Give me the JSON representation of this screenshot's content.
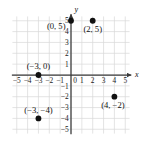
{
  "chart_data": {
    "type": "scatter",
    "title": "",
    "xlabel": "x",
    "ylabel": "y",
    "xlim": [
      -5.5,
      5.5
    ],
    "ylim": [
      -5.5,
      5.5
    ],
    "grid": true,
    "grid_step": 1,
    "legend": "none",
    "points": [
      {
        "x": 0,
        "y": 5,
        "label": "(0, 5)",
        "label_pos": "left"
      },
      {
        "x": 2,
        "y": 5,
        "label": "(2, 5)",
        "label_pos": "below"
      },
      {
        "x": -3,
        "y": 0,
        "label": "(−3, 0)",
        "label_pos": "above"
      },
      {
        "x": -3,
        "y": -4,
        "label": "(−3, −4)",
        "label_pos": "above"
      },
      {
        "x": 4,
        "y": -2,
        "label": "(4, −2)",
        "label_pos": "below-left"
      }
    ],
    "x_ticks": [
      {
        "value": -5,
        "label": "−5"
      },
      {
        "value": -4,
        "label": "−4"
      },
      {
        "value": -3,
        "label": "−3"
      },
      {
        "value": -2,
        "label": "−2"
      },
      {
        "value": -1,
        "label": "−1"
      },
      {
        "value": 0,
        "label": "0"
      },
      {
        "value": 1,
        "label": "1"
      },
      {
        "value": 2,
        "label": "2"
      },
      {
        "value": 3,
        "label": "3"
      },
      {
        "value": 4,
        "label": "4"
      },
      {
        "value": 5,
        "label": "5"
      }
    ],
    "y_ticks": [
      {
        "value": 5,
        "label": "5"
      },
      {
        "value": 4,
        "label": "4"
      },
      {
        "value": 3,
        "label": "3"
      },
      {
        "value": 2,
        "label": "2"
      },
      {
        "value": 1,
        "label": "1"
      },
      {
        "value": -1,
        "label": "−1"
      },
      {
        "value": -2,
        "label": "−2"
      },
      {
        "value": -3,
        "label": "−3"
      },
      {
        "value": -4,
        "label": "−4"
      },
      {
        "value": -5,
        "label": "−5"
      }
    ],
    "axis_labels": {
      "x": "x",
      "y": "y"
    },
    "colors": {
      "grid": "#d8d8d8",
      "axis": "#3a3a3a",
      "point": "#111111",
      "text": "#111111",
      "background": "#ffffff"
    }
  }
}
